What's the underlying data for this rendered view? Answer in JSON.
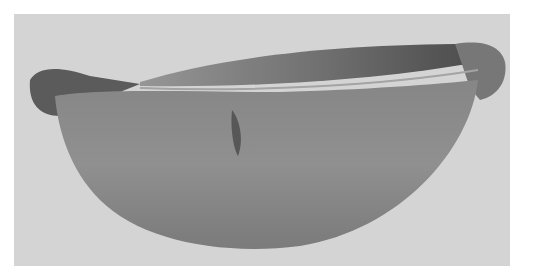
{
  "image": {
    "subject": "wooden bowl with handles",
    "style": "grayscale photograph",
    "colors": {
      "page": "#ffffff",
      "backdrop": "#dcdcdc",
      "bowl_body": "#8e8e8e",
      "bowl_shadow": "#6a6a6a",
      "bowl_interior": "#5a5a5a",
      "rim": "#a8a8a8"
    }
  }
}
